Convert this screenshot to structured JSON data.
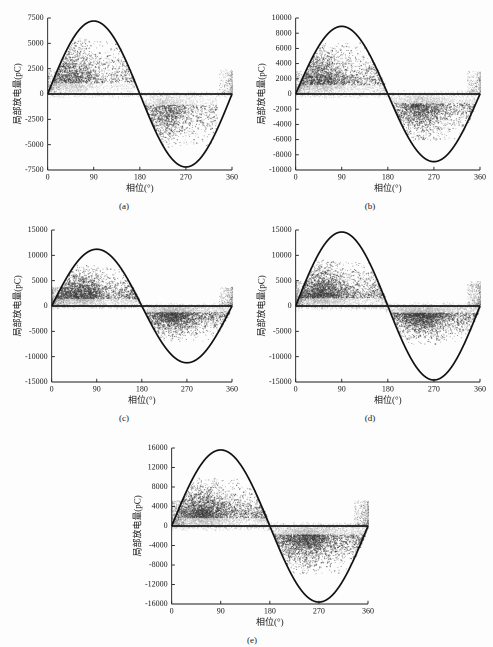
{
  "figure": {
    "background_color": "#fdfdfd",
    "curve_color": "#111111",
    "scatter_dark_color": "#3a3a3a",
    "scatter_light_color": "#9a9a9a",
    "axis_color": "#1a1a1a",
    "xlabel": "相位(°)",
    "ylabel": "局部放电量(pC)",
    "xticks": [
      0,
      90,
      180,
      270,
      360
    ],
    "xlim": [
      0,
      360
    ]
  },
  "panels": [
    {
      "id": "panel-a",
      "caption": "(a)",
      "chart_data": {
        "type": "scatter",
        "title": "",
        "xlabel": "相位(°)",
        "ylabel": "局部放电量(pC)",
        "xlim": [
          0,
          360
        ],
        "ylim": [
          -7500,
          7500
        ],
        "xticks": [
          0,
          90,
          180,
          270,
          360
        ],
        "yticks": [
          -7500,
          -5000,
          -2500,
          0,
          2500,
          5000,
          7500
        ],
        "ytick_labels": [
          "-7500",
          "-5000",
          "-2500",
          "0",
          "2500",
          "5000",
          "7500"
        ],
        "grid": false,
        "legend": "none",
        "series": [
          {
            "name": "sine-reference",
            "type": "line",
            "amplitude": 7200,
            "period_deg": 360,
            "phase_offset_deg": 0,
            "description": "Reference sinusoid peaking at 90° and troughing at 270°"
          },
          {
            "name": "positive-half-discharges",
            "type": "scatter",
            "phase_range_deg": [
              0,
              170
            ],
            "peak_phase_deg": 45,
            "magnitude_range_pC": [
              50,
              5600
            ],
            "typical_magnitude_pC": 2700,
            "n_points": 2600
          },
          {
            "name": "negative-half-discharges",
            "type": "scatter",
            "phase_range_deg": [
              185,
              330
            ],
            "peak_phase_deg": 230,
            "magnitude_range_pC": [
              -5200,
              -200
            ],
            "typical_magnitude_pC": -2500,
            "n_points": 1900
          },
          {
            "name": "near-zero-band",
            "type": "scatter",
            "phase_range_deg": [
              0,
              360
            ],
            "magnitude_range_pC": [
              -400,
              400
            ],
            "n_points": 900
          }
        ]
      }
    },
    {
      "id": "panel-b",
      "caption": "(b)",
      "chart_data": {
        "type": "scatter",
        "title": "",
        "xlabel": "相位(°)",
        "ylabel": "局部放电量(pC)",
        "xlim": [
          0,
          360
        ],
        "ylim": [
          -10000,
          10000
        ],
        "xticks": [
          0,
          90,
          180,
          270,
          360
        ],
        "yticks": [
          -10000,
          -8000,
          -6000,
          -4000,
          -2000,
          0,
          2000,
          4000,
          6000,
          8000,
          10000
        ],
        "ytick_labels": [
          "-10000",
          "-8000",
          "-6000",
          "-4000",
          "-2000",
          "0",
          "2000",
          "4000",
          "6000",
          "8000",
          "10000"
        ],
        "grid": false,
        "legend": "none",
        "series": [
          {
            "name": "sine-reference",
            "type": "line",
            "amplitude": 8900,
            "period_deg": 360,
            "phase_offset_deg": 0
          },
          {
            "name": "positive-half-discharges",
            "type": "scatter",
            "phase_range_deg": [
              0,
              175
            ],
            "peak_phase_deg": 50,
            "magnitude_range_pC": [
              50,
              6800
            ],
            "typical_magnitude_pC": 3000,
            "n_points": 3000
          },
          {
            "name": "negative-half-discharges",
            "type": "scatter",
            "phase_range_deg": [
              180,
              350
            ],
            "peak_phase_deg": 240,
            "magnitude_range_pC": [
              -6200,
              -200
            ],
            "typical_magnitude_pC": -2800,
            "n_points": 2600
          },
          {
            "name": "near-zero-band",
            "type": "scatter",
            "phase_range_deg": [
              0,
              360
            ],
            "magnitude_range_pC": [
              -600,
              600
            ],
            "n_points": 1000
          }
        ]
      }
    },
    {
      "id": "panel-c",
      "caption": "(c)",
      "chart_data": {
        "type": "scatter",
        "title": "",
        "xlabel": "相位(°)",
        "ylabel": "局部放电量(pC)",
        "xlim": [
          0,
          360
        ],
        "ylim": [
          -15000,
          15000
        ],
        "xticks": [
          0,
          90,
          180,
          270,
          360
        ],
        "yticks": [
          -15000,
          -10000,
          -5000,
          0,
          5000,
          10000,
          15000
        ],
        "ytick_labels": [
          "-15000",
          "-10000",
          "-5000",
          "0",
          "5000",
          "10000",
          "15000"
        ],
        "grid": false,
        "legend": "none",
        "series": [
          {
            "name": "sine-reference",
            "type": "line",
            "amplitude": 11200,
            "period_deg": 360,
            "phase_offset_deg": 0
          },
          {
            "name": "positive-half-discharges",
            "type": "scatter",
            "phase_range_deg": [
              0,
              175
            ],
            "peak_phase_deg": 55,
            "magnitude_range_pC": [
              50,
              8200
            ],
            "typical_magnitude_pC": 3600,
            "n_points": 3400
          },
          {
            "name": "negative-half-discharges",
            "type": "scatter",
            "phase_range_deg": [
              180,
              355
            ],
            "peak_phase_deg": 240,
            "magnitude_range_pC": [
              -7000,
              -200
            ],
            "typical_magnitude_pC": -2800,
            "n_points": 3000
          },
          {
            "name": "near-zero-band",
            "type": "scatter",
            "phase_range_deg": [
              0,
              360
            ],
            "magnitude_range_pC": [
              -700,
              700
            ],
            "n_points": 1200
          }
        ]
      }
    },
    {
      "id": "panel-d",
      "caption": "(d)",
      "chart_data": {
        "type": "scatter",
        "title": "",
        "xlabel": "相位(°)",
        "ylabel": "局部放电量(pC)",
        "xlim": [
          0,
          360
        ],
        "ylim": [
          -15000,
          15000
        ],
        "xticks": [
          0,
          90,
          180,
          270,
          360
        ],
        "yticks": [
          -15000,
          -10000,
          -5000,
          0,
          5000,
          10000,
          15000
        ],
        "ytick_labels": [
          "-15000",
          "-10000",
          "-5000",
          "0",
          "5000",
          "10000",
          "15000"
        ],
        "grid": false,
        "legend": "none",
        "series": [
          {
            "name": "sine-reference",
            "type": "line",
            "amplitude": 14600,
            "period_deg": 360,
            "phase_offset_deg": 0
          },
          {
            "name": "positive-half-discharges",
            "type": "scatter",
            "phase_range_deg": [
              0,
              180
            ],
            "peak_phase_deg": 50,
            "magnitude_range_pC": [
              50,
              9200
            ],
            "typical_magnitude_pC": 4000,
            "n_points": 3800
          },
          {
            "name": "negative-half-discharges",
            "type": "scatter",
            "phase_range_deg": [
              175,
              360
            ],
            "peak_phase_deg": 245,
            "magnitude_range_pC": [
              -7500,
              -200
            ],
            "typical_magnitude_pC": -3000,
            "n_points": 3400
          },
          {
            "name": "near-zero-band",
            "type": "scatter",
            "phase_range_deg": [
              0,
              360
            ],
            "magnitude_range_pC": [
              -900,
              900
            ],
            "n_points": 1500
          }
        ]
      }
    },
    {
      "id": "panel-e",
      "caption": "(e)",
      "chart_data": {
        "type": "scatter",
        "title": "",
        "xlabel": "相位(°)",
        "ylabel": "局部放电量(pC)",
        "xlim": [
          0,
          360
        ],
        "ylim": [
          -16000,
          16000
        ],
        "xticks": [
          0,
          90,
          180,
          270,
          360
        ],
        "yticks": [
          -16000,
          -12000,
          -8000,
          -4000,
          0,
          4000,
          8000,
          12000,
          16000
        ],
        "ytick_labels": [
          "-16000",
          "-12000",
          "-8000",
          "-4000",
          "0",
          "4000",
          "8000",
          "12000",
          "16000"
        ],
        "grid": false,
        "legend": "none",
        "series": [
          {
            "name": "sine-reference",
            "type": "line",
            "amplitude": 15600,
            "period_deg": 360,
            "phase_offset_deg": 0
          },
          {
            "name": "positive-half-discharges",
            "type": "scatter",
            "phase_range_deg": [
              0,
              180
            ],
            "peak_phase_deg": 55,
            "magnitude_range_pC": [
              50,
              10000
            ],
            "typical_magnitude_pC": 4200,
            "n_points": 4000
          },
          {
            "name": "negative-half-discharges",
            "type": "scatter",
            "phase_range_deg": [
              175,
              360
            ],
            "peak_phase_deg": 245,
            "magnitude_range_pC": [
              -10000,
              -200
            ],
            "typical_magnitude_pC": -4000,
            "n_points": 3800
          },
          {
            "name": "near-zero-band",
            "type": "scatter",
            "phase_range_deg": [
              0,
              360
            ],
            "magnitude_range_pC": [
              -1000,
              1000
            ],
            "n_points": 1600
          }
        ]
      }
    }
  ],
  "layout": {
    "panel_positions": [
      {
        "id": "panel-a",
        "left": 8,
        "top": 6,
        "width": 232,
        "height": 206
      },
      {
        "id": "panel-b",
        "left": 252,
        "top": 6,
        "width": 236,
        "height": 206
      },
      {
        "id": "panel-c",
        "left": 8,
        "top": 218,
        "width": 232,
        "height": 206
      },
      {
        "id": "panel-d",
        "left": 252,
        "top": 218,
        "width": 236,
        "height": 206
      },
      {
        "id": "panel-e",
        "left": 128,
        "top": 436,
        "width": 248,
        "height": 210
      }
    ]
  }
}
